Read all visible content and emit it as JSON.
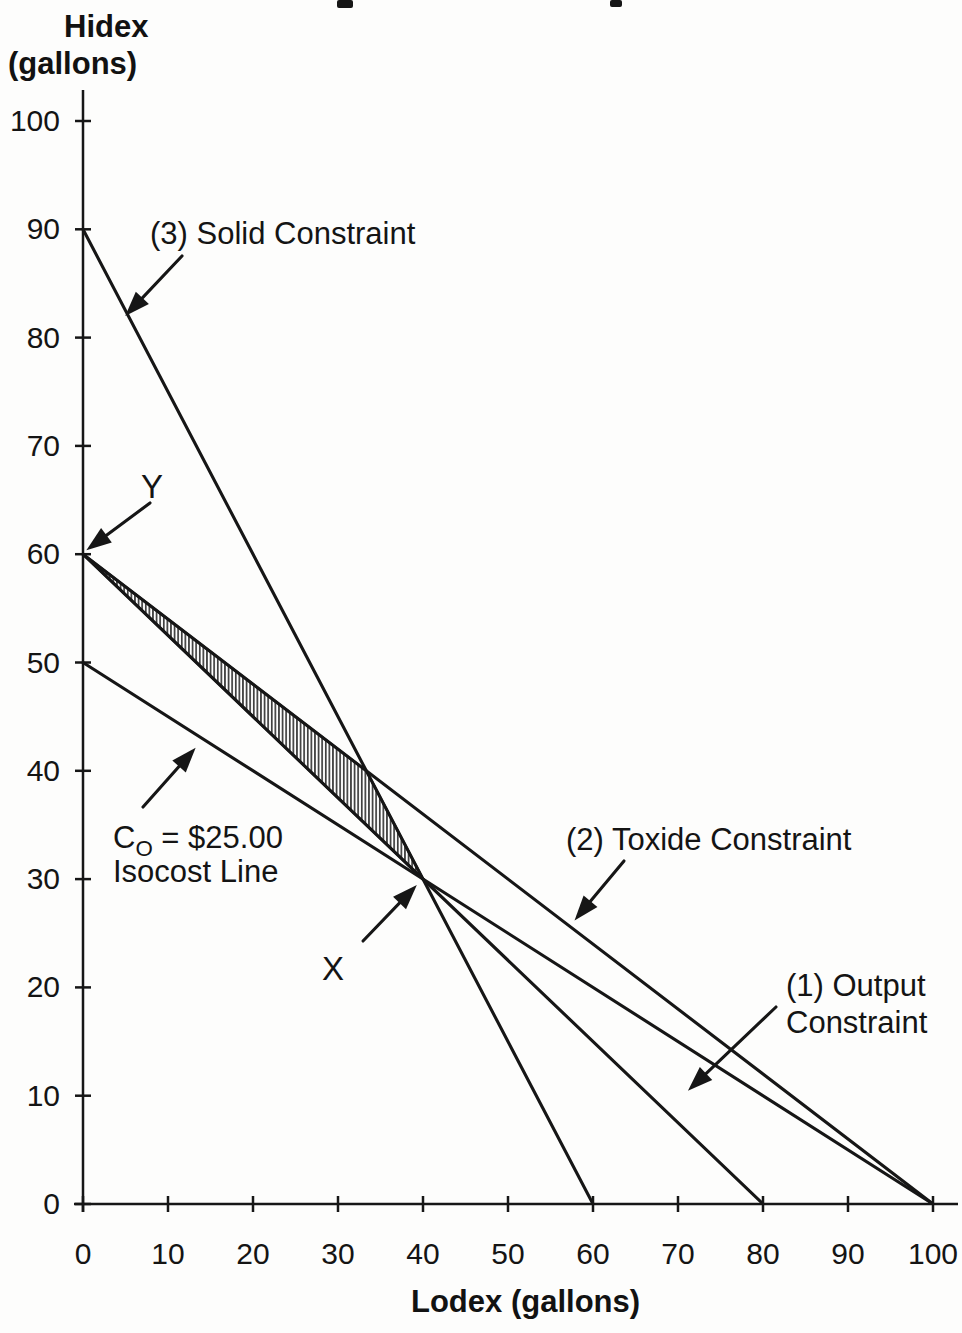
{
  "page": {
    "background": "#fdfdfc",
    "ink": "#161616",
    "cropped_title_marks": [
      {
        "x": 337,
        "y": 0,
        "w": 16,
        "h": 8
      },
      {
        "x": 610,
        "y": 0,
        "w": 12,
        "h": 7
      }
    ]
  },
  "chart_data": {
    "type": "line",
    "title": "",
    "xlabel": "Lodex (gallons)",
    "ylabel": "Hidex (gallons)",
    "ylabel_lines": [
      "Hidex",
      "(gallons)"
    ],
    "xlim": [
      0,
      100
    ],
    "ylim": [
      0,
      100
    ],
    "xticks": [
      0,
      10,
      20,
      30,
      40,
      50,
      60,
      70,
      80,
      90,
      100
    ],
    "yticks": [
      0,
      10,
      20,
      30,
      40,
      50,
      60,
      70,
      80,
      90,
      100
    ],
    "grid": false,
    "legend": "none",
    "series": [
      {
        "name": "(3) Solid Constraint",
        "points": [
          [
            0,
            90
          ],
          [
            60,
            0
          ]
        ]
      },
      {
        "name": "(2) Toxide Constraint",
        "points": [
          [
            0,
            60
          ],
          [
            100,
            0
          ]
        ]
      },
      {
        "name": "(1) Output Constraint",
        "points": [
          [
            0,
            60
          ],
          [
            80,
            0
          ]
        ]
      },
      {
        "name": "C_O = $25.00 Isocost Line",
        "points": [
          [
            0,
            50
          ],
          [
            100,
            0
          ]
        ]
      }
    ],
    "feasible_region": {
      "vertices": [
        [
          0,
          60
        ],
        [
          33.33,
          40
        ],
        [
          40,
          30
        ]
      ],
      "fill": "vertical-hatch"
    },
    "key_points": [
      {
        "label": "Y",
        "x": 0,
        "y": 60
      },
      {
        "label": "X",
        "x": 40,
        "y": 30
      }
    ],
    "annotations": [
      {
        "id": "solid-constraint-label",
        "lines": [
          "(3) Solid Constraint"
        ],
        "text_x": 150,
        "text_y": 244,
        "font": 31,
        "arrow": {
          "x1": 182,
          "y1": 256,
          "x2": 130,
          "y2": 311
        }
      },
      {
        "id": "point-y-label",
        "lines": [
          "Y"
        ],
        "text_x": 141,
        "text_y": 498,
        "font": 33,
        "arrow": {
          "x1": 150,
          "y1": 503,
          "x2": 92,
          "y2": 546
        }
      },
      {
        "id": "isocost-label",
        "lines": [
          {
            "pre": "C",
            "sub": "O",
            "post": " = $25.00"
          },
          "Isocost Line"
        ],
        "text_x": 113,
        "text_y": 848,
        "font": 31,
        "line_h": 34,
        "arrow": {
          "x1": 143,
          "y1": 807,
          "x2": 191,
          "y2": 753
        }
      },
      {
        "id": "point-x-label",
        "lines": [
          "X"
        ],
        "text_x": 322,
        "text_y": 980,
        "font": 33,
        "arrow": {
          "x1": 363,
          "y1": 941,
          "x2": 412,
          "y2": 890
        }
      },
      {
        "id": "toxide-constraint-label",
        "lines": [
          "(2) Toxide Constraint"
        ],
        "text_x": 566,
        "text_y": 850,
        "font": 31,
        "arrow": {
          "x1": 624,
          "y1": 861,
          "x2": 579,
          "y2": 915
        }
      },
      {
        "id": "output-constraint-label",
        "lines": [
          "(1) Output",
          "Constraint"
        ],
        "text_x": 786,
        "text_y": 996,
        "font": 31,
        "line_h": 37,
        "arrow": {
          "x1": 776,
          "y1": 1007,
          "x2": 693,
          "y2": 1086
        }
      }
    ]
  }
}
